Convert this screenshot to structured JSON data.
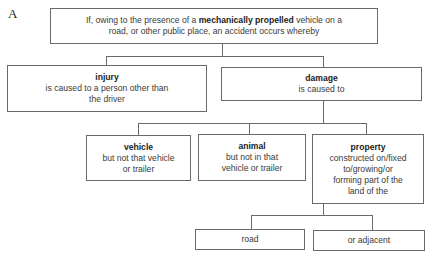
{
  "figure_label": "A",
  "nodes": {
    "root": {
      "text_before": "If, owing to the presence of a ",
      "text_bold": "mechanically propelled",
      "text_after_line1": " vehicle on a",
      "text_line2": "road, or other public place, an accident occurs whereby"
    },
    "injury": {
      "title": "injury",
      "line1": "is caused to a person other than",
      "line2": "the driver"
    },
    "damage": {
      "title": "damage",
      "line1": "is caused to"
    },
    "vehicle": {
      "title": "vehicle",
      "line1": "but not that vehicle",
      "line2": "or trailer"
    },
    "animal": {
      "title": "animal",
      "line1": "but not in that",
      "line2": "vehicle or trailer"
    },
    "property": {
      "title": "property",
      "line1": "constructed on/fixed",
      "line2": "to/growing/or",
      "line3": "forming part of the",
      "line4": "land of the"
    },
    "road": {
      "label": "road"
    },
    "adjacent": {
      "label": "or adjacent"
    }
  },
  "style": {
    "line_color": "#6a6a6a",
    "text_color": "#3a3a3a"
  }
}
